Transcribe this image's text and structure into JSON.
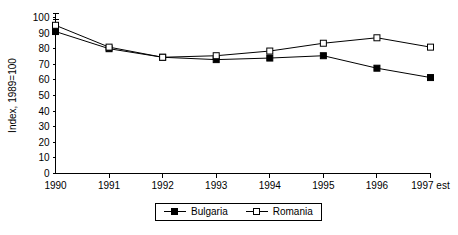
{
  "chart_data": {
    "type": "line",
    "title": "",
    "xlabel": "",
    "ylabel": "Index, 1989=100",
    "categories": [
      "1990",
      "1991",
      "1992",
      "1993",
      "1994",
      "1995",
      "1996",
      "1997 est"
    ],
    "x_tick_labels": [
      "1990",
      "1991",
      "1992",
      "1993",
      "1994",
      "1995",
      "1996",
      "1997 est"
    ],
    "y_tick_labels": [
      "0",
      "10",
      "20",
      "30",
      "40",
      "50",
      "60",
      "70",
      "80",
      "90",
      "100"
    ],
    "y_ticks": [
      0,
      10,
      20,
      30,
      40,
      50,
      60,
      70,
      80,
      90,
      100
    ],
    "ylim": [
      0,
      100
    ],
    "grid": false,
    "legend_position": "bottom-center",
    "series": [
      {
        "name": "Bulgaria",
        "marker": "filled-square",
        "color": "#000000",
        "values": [
          91,
          80,
          74.5,
          73,
          74,
          75.5,
          67.5,
          61.5
        ]
      },
      {
        "name": "Romania",
        "marker": "open-square",
        "color": "#000000",
        "values": [
          95,
          81,
          74.5,
          75.5,
          78.5,
          83.5,
          87,
          81
        ]
      }
    ]
  },
  "legend": {
    "items": [
      {
        "label": "Bulgaria",
        "marker": "filled"
      },
      {
        "label": "Romania",
        "marker": "open"
      }
    ]
  },
  "axis": {
    "y_title": "Index, 1989=100"
  }
}
